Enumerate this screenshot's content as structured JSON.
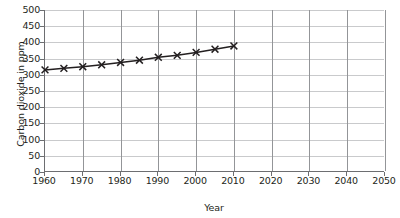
{
  "chart_data": {
    "type": "line",
    "title": "",
    "xlabel": "Year",
    "ylabel": "Carbon dioxide in ppm",
    "xlim": [
      1960,
      2050
    ],
    "ylim": [
      0,
      500
    ],
    "xticks": [
      1960,
      1970,
      1980,
      1990,
      2000,
      2010,
      2020,
      2030,
      2040,
      2050
    ],
    "yticks": [
      0,
      50,
      100,
      150,
      200,
      250,
      300,
      350,
      400,
      450,
      500
    ],
    "xtick_labels": [
      "1960",
      "1970",
      "1980",
      "1990",
      "2000",
      "2010",
      "2020",
      "2030",
      "2040",
      "2050"
    ],
    "ytick_labels": [
      "0",
      "50",
      "100",
      "150",
      "200",
      "250",
      "300",
      "350",
      "400",
      "450",
      "500"
    ],
    "grid": true,
    "legend": null,
    "marker": "x",
    "line_color": "#231f20",
    "grid_color_horizontal": "#c9cacc",
    "grid_color_vertical": "#939598",
    "axis_color": "#6d6e71",
    "x": [
      1960,
      1965,
      1970,
      1975,
      1980,
      1985,
      1990,
      1995,
      2000,
      2005,
      2010
    ],
    "values": [
      315,
      320,
      325,
      331,
      338,
      345,
      354,
      360,
      369,
      379,
      389
    ],
    "series": [
      {
        "name": "Carbon dioxide concentration",
        "x": [
          1960,
          1965,
          1970,
          1975,
          1980,
          1985,
          1990,
          1995,
          2000,
          2005,
          2010
        ],
        "values": [
          315,
          320,
          325,
          331,
          338,
          345,
          354,
          360,
          369,
          379,
          389
        ]
      }
    ]
  }
}
